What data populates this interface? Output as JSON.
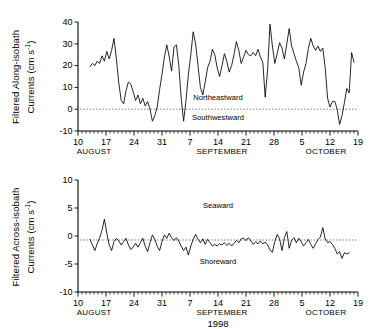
{
  "figure": {
    "year_label": "1998",
    "background": "#ffffff",
    "line_color": "#000000",
    "zero_line_color": "#555555"
  },
  "panels": [
    {
      "id": "along-isobath",
      "ylabel_line1": "Filtered Along-isobath",
      "ylabel_line2": "Currents (cm s",
      "ylabel_sup": "-1",
      "ylabel_close": ")",
      "annotation_upper": "Northeastward",
      "annotation_lower": "Southwestward",
      "yticks": [
        -10,
        0,
        10,
        20,
        30,
        40
      ],
      "ytick_labels": [
        "-10",
        "0",
        "10",
        "20",
        "30",
        "40"
      ]
    },
    {
      "id": "across-isobath",
      "ylabel_line1": "Filtered Across-isobath",
      "ylabel_line2": "Currents (cm s",
      "ylabel_sup": "-1",
      "ylabel_close": ")",
      "annotation_upper": "Seaward",
      "annotation_lower": "Shoreward",
      "yticks": [
        -10,
        -5,
        0,
        5,
        10
      ],
      "ytick_labels": [
        "-10",
        "-5",
        "0",
        "5",
        "10"
      ]
    }
  ],
  "xaxis": {
    "tick_days": [
      0,
      7,
      14,
      21,
      28,
      35,
      42,
      49,
      56,
      63,
      70
    ],
    "tick_labels": [
      "10",
      "17",
      "24",
      "31",
      "7",
      "14",
      "21",
      "28",
      "5",
      "12",
      "19"
    ],
    "month_labels": [
      {
        "label": "AUGUST",
        "day": 4
      },
      {
        "label": "SEPTEMBER",
        "day": 36
      },
      {
        "label": "OCTOBER",
        "day": 62
      }
    ],
    "xmin": 0,
    "xmax": 70,
    "minor_step_days": 1
  },
  "chart_data": [
    {
      "type": "line",
      "title": "Filtered Along-isobath Currents (cm s-1)",
      "xlabel": "1998",
      "ylabel": "Filtered Along-isobath Currents (cm s-1)",
      "xlim": [
        0,
        70
      ],
      "ylim": [
        -10,
        40
      ],
      "grid": false,
      "legend": "none",
      "zero_reference_line": 0,
      "annotations": [
        {
          "text": "Northeastward",
          "x": 35,
          "y": 4
        },
        {
          "text": "Southwestward",
          "x": 35,
          "y": -5
        }
      ],
      "xtick_labels": [
        "10",
        "17",
        "24",
        "31",
        "7",
        "14",
        "21",
        "28",
        "5",
        "12",
        "19"
      ],
      "xtick_values": [
        0,
        7,
        14,
        21,
        28,
        35,
        42,
        49,
        56,
        63,
        70
      ],
      "series": [
        {
          "name": "along-isobath current",
          "x": [
            3.0,
            3.6,
            4.2,
            4.8,
            5.4,
            6.0,
            6.6,
            7.2,
            7.8,
            8.4,
            9.0,
            9.6,
            10.2,
            10.8,
            11.4,
            12.0,
            12.6,
            13.2,
            13.8,
            14.4,
            15.0,
            15.6,
            16.2,
            16.8,
            17.4,
            18.0,
            18.6,
            19.2,
            19.8,
            20.4,
            21.0,
            21.6,
            22.2,
            22.8,
            23.4,
            24.0,
            24.6,
            25.2,
            25.8,
            26.4,
            27.0,
            27.6,
            28.2,
            28.8,
            29.4,
            30.0,
            30.6,
            31.2,
            31.8,
            32.4,
            33.0,
            33.6,
            34.2,
            34.8,
            35.4,
            36.0,
            36.6,
            37.2,
            37.8,
            38.4,
            39.0,
            39.6,
            40.2,
            40.8,
            41.4,
            42.0,
            42.6,
            43.2,
            43.8,
            44.4,
            45.0,
            45.6,
            46.2,
            46.8,
            47.4,
            48.0,
            48.6,
            49.2,
            49.8,
            50.4,
            51.0,
            51.6,
            52.2,
            52.8,
            53.4,
            54.0,
            54.6,
            55.2,
            55.8,
            56.4,
            57.0,
            57.6,
            58.2,
            58.8,
            59.4,
            60.0,
            60.6,
            61.2,
            61.8,
            62.4,
            63.0,
            63.6,
            64.2,
            64.8,
            65.4,
            66.0,
            66.6,
            67.2,
            67.8,
            68.4,
            69.0
          ],
          "y": [
            19.5,
            21.0,
            20.0,
            22.0,
            21.0,
            24.5,
            22.0,
            26.5,
            23.0,
            27.0,
            32.5,
            23.0,
            12.0,
            4.0,
            2.5,
            8.5,
            12.5,
            11.5,
            8.0,
            4.0,
            6.5,
            2.5,
            5.0,
            1.5,
            3.5,
            0.0,
            -5.5,
            -3.0,
            1.0,
            9.0,
            16.0,
            24.0,
            29.5,
            24.0,
            17.5,
            28.5,
            29.5,
            20.0,
            5.0,
            -5.5,
            4.0,
            16.0,
            25.0,
            35.5,
            30.0,
            20.0,
            10.0,
            6.5,
            12.5,
            19.0,
            22.0,
            27.5,
            25.0,
            19.0,
            15.0,
            20.0,
            25.5,
            22.0,
            17.0,
            20.0,
            25.0,
            31.0,
            27.0,
            21.0,
            24.0,
            27.0,
            25.0,
            24.5,
            26.0,
            24.5,
            27.5,
            24.0,
            21.5,
            5.5,
            18.0,
            39.0,
            29.0,
            21.0,
            25.5,
            30.5,
            28.0,
            23.0,
            30.0,
            37.0,
            29.0,
            25.5,
            22.0,
            19.0,
            11.0,
            17.0,
            21.0,
            28.0,
            32.5,
            29.0,
            27.0,
            29.0,
            26.5,
            28.0,
            19.0,
            5.0,
            1.0,
            3.5,
            3.5,
            0.0,
            -7.0,
            -3.0,
            3.0,
            9.5,
            7.5,
            26.0,
            21.5
          ]
        }
      ]
    },
    {
      "type": "line",
      "title": "Filtered Across-isobath Currents (cm s-1)",
      "xlabel": "1998",
      "ylabel": "Filtered Across-isobath Currents (cm s-1)",
      "xlim": [
        0,
        70
      ],
      "ylim": [
        -10,
        10
      ],
      "grid": false,
      "legend": "none",
      "zero_reference_line": 0,
      "annotations": [
        {
          "text": "Seaward",
          "x": 35,
          "y": 5
        },
        {
          "text": "Shoreward",
          "x": 35,
          "y": -5
        }
      ],
      "xtick_labels": [
        "10",
        "17",
        "24",
        "31",
        "7",
        "14",
        "21",
        "28",
        "5",
        "12",
        "19"
      ],
      "xtick_values": [
        0,
        7,
        14,
        21,
        28,
        35,
        42,
        49,
        56,
        63,
        70
      ],
      "series": [
        {
          "name": "across-isobath current",
          "x": [
            3.0,
            3.6,
            4.2,
            4.8,
            5.4,
            6.0,
            6.6,
            7.2,
            7.8,
            8.4,
            9.0,
            9.6,
            10.2,
            10.8,
            11.4,
            12.0,
            12.6,
            13.2,
            13.8,
            14.4,
            15.0,
            15.6,
            16.2,
            16.8,
            17.4,
            18.0,
            18.6,
            19.2,
            19.8,
            20.4,
            21.0,
            21.6,
            22.2,
            22.8,
            23.4,
            24.0,
            24.6,
            25.2,
            25.8,
            26.4,
            27.0,
            27.6,
            28.2,
            28.8,
            29.4,
            30.0,
            30.6,
            31.2,
            31.8,
            32.4,
            33.0,
            33.6,
            34.2,
            34.8,
            35.4,
            36.0,
            36.6,
            37.2,
            37.8,
            38.4,
            39.0,
            39.6,
            40.2,
            40.8,
            41.4,
            42.0,
            42.6,
            43.2,
            43.8,
            44.4,
            45.0,
            45.6,
            46.2,
            46.8,
            47.4,
            48.0,
            48.6,
            49.2,
            49.8,
            50.4,
            51.0,
            51.6,
            52.2,
            52.8,
            53.4,
            54.0,
            54.6,
            55.2,
            55.8,
            56.4,
            57.0,
            57.6,
            58.2,
            58.8,
            59.4,
            60.0,
            60.6,
            61.2,
            61.8,
            62.4,
            63.0,
            63.6,
            64.2,
            64.8,
            65.4,
            66.0,
            66.6,
            67.2,
            67.8,
            68.4,
            69.0
          ],
          "y": [
            -0.6,
            -1.6,
            -2.6,
            -1.4,
            -0.3,
            1.0,
            3.0,
            0.5,
            -1.6,
            -2.6,
            -1.0,
            -0.4,
            -0.9,
            -1.6,
            -1.0,
            -0.4,
            -1.6,
            -2.4,
            -2.0,
            -1.3,
            -2.0,
            -1.2,
            -0.4,
            -1.8,
            -2.8,
            -1.2,
            0.2,
            -0.6,
            -1.8,
            -2.6,
            -1.0,
            0.2,
            -0.4,
            0.5,
            -0.3,
            -0.8,
            -0.3,
            -0.9,
            -1.8,
            -2.6,
            -2.0,
            -3.4,
            -1.8,
            -0.6,
            0.3,
            -0.6,
            -1.2,
            -0.5,
            -1.5,
            -0.6,
            -1.2,
            -1.8,
            -1.5,
            -1.8,
            -1.4,
            -1.6,
            -1.2,
            -1.7,
            -1.3,
            -1.8,
            -1.3,
            -0.8,
            -1.2,
            -0.5,
            -0.4,
            -0.8,
            -0.3,
            -0.9,
            -1.5,
            -1.0,
            -1.4,
            -0.9,
            -1.4,
            -1.1,
            -1.6,
            -2.5,
            -2.9,
            -1.0,
            0.3,
            -0.5,
            -2.6,
            -0.3,
            0.8,
            -2.2,
            -0.8,
            -0.3,
            -1.2,
            -0.4,
            -1.0,
            -1.8,
            -1.2,
            -0.6,
            -1.5,
            -2.2,
            -1.4,
            -0.6,
            -0.2,
            1.5,
            -0.5,
            -1.2,
            -1.0,
            -1.5,
            -2.2,
            -3.2,
            -2.8,
            -4.0,
            -3.0,
            -3.2,
            -3.0
          ]
        }
      ]
    }
  ]
}
